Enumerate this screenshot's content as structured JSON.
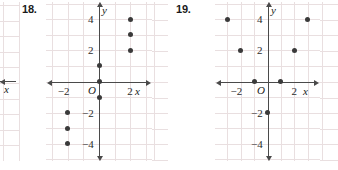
{
  "page": {
    "width": 338,
    "height": 170,
    "background": "#ffffff",
    "grid_color": "#e9dfe0",
    "axis_color": "#4a4a4a",
    "point_color": "#3a3a3a",
    "text_color": "#1a1a1a"
  },
  "exercises": [
    {
      "number": "18.",
      "axis_labels": {
        "x": "x",
        "y": "y"
      },
      "origin_label": "O",
      "x_ticks": [
        {
          "value": -2,
          "label": "−2"
        },
        {
          "value": 2,
          "label": "2"
        }
      ],
      "y_ticks": [
        {
          "value": 4,
          "label": "4"
        },
        {
          "value": 2,
          "label": "2"
        },
        {
          "value": -2,
          "label": "−2"
        },
        {
          "value": -4,
          "label": "−4"
        }
      ]
    },
    {
      "number": "19.",
      "axis_labels": {
        "x": "x",
        "y": "y"
      },
      "origin_label": "O",
      "x_ticks": [
        {
          "value": -2,
          "label": "−2"
        },
        {
          "value": 2,
          "label": "2"
        }
      ],
      "y_ticks": [
        {
          "value": 4,
          "label": "4"
        },
        {
          "value": 2,
          "label": "2"
        },
        {
          "value": -2,
          "label": "−2"
        },
        {
          "value": -4,
          "label": "−4"
        }
      ]
    }
  ],
  "chart_data": [
    {
      "type": "scatter",
      "title": "18.",
      "xlabel": "x",
      "ylabel": "y",
      "xlim": [
        -3.4,
        3.4
      ],
      "ylim": [
        -5.1,
        5.1
      ],
      "grid": true,
      "grid_step": 1,
      "xtick_labels": [
        "−2",
        "2"
      ],
      "ytick_labels": [
        "4",
        "2",
        "−2",
        "−4"
      ],
      "points": [
        {
          "x": 0,
          "y": 1
        },
        {
          "x": 0,
          "y": 0
        },
        {
          "x": 0,
          "y": -1
        },
        {
          "x": 2,
          "y": 2
        },
        {
          "x": 2,
          "y": 3
        },
        {
          "x": 2,
          "y": 4
        },
        {
          "x": -2,
          "y": -2
        },
        {
          "x": -2,
          "y": -3
        },
        {
          "x": -2,
          "y": -4
        }
      ]
    },
    {
      "type": "scatter",
      "title": "19.",
      "xlabel": "x",
      "ylabel": "y",
      "xlim": [
        -3.9,
        3.9
      ],
      "ylim": [
        -5.1,
        5.1
      ],
      "grid": true,
      "grid_step": 1,
      "xtick_labels": [
        "−2",
        "2"
      ],
      "ytick_labels": [
        "4",
        "2",
        "−2",
        "−4"
      ],
      "points": [
        {
          "x": -3,
          "y": 4
        },
        {
          "x": 3,
          "y": 4
        },
        {
          "x": -2,
          "y": 2
        },
        {
          "x": 2,
          "y": 2
        },
        {
          "x": -1,
          "y": 0
        },
        {
          "x": 1,
          "y": 0
        },
        {
          "x": 0,
          "y": -2
        }
      ]
    }
  ],
  "edge_fragments": {
    "left": {
      "axis_label": "x"
    },
    "right": {
      "axis_label": "x"
    }
  }
}
